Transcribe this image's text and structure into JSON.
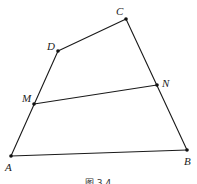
{
  "diagram": {
    "type": "geometry",
    "points": {
      "A": {
        "label": "A",
        "x": 11,
        "y": 156,
        "lx": 5,
        "ly": 171
      },
      "B": {
        "label": "B",
        "x": 187,
        "y": 150,
        "lx": 184,
        "ly": 165
      },
      "C": {
        "label": "C",
        "x": 126,
        "y": 19,
        "lx": 116,
        "ly": 15
      },
      "D": {
        "label": "D",
        "x": 58,
        "y": 51,
        "lx": 47,
        "ly": 50
      },
      "M": {
        "label": "M",
        "x": 34,
        "y": 104,
        "lx": 22,
        "ly": 102
      },
      "N": {
        "label": "N",
        "x": 157,
        "y": 85,
        "lx": 162,
        "ly": 87
      }
    },
    "segments": [
      [
        "A",
        "B"
      ],
      [
        "B",
        "C"
      ],
      [
        "C",
        "D"
      ],
      [
        "D",
        "A"
      ],
      [
        "M",
        "N"
      ]
    ],
    "caption": "图 3.4"
  }
}
